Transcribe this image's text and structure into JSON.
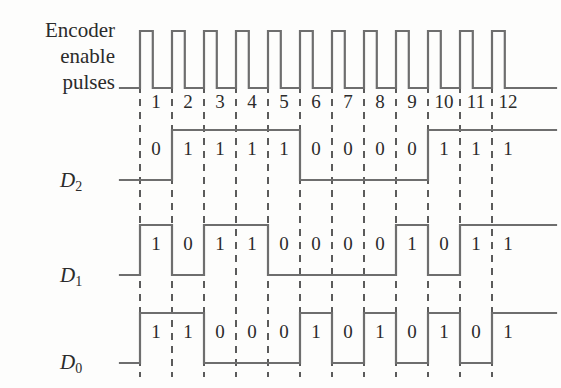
{
  "figure": {
    "title_lines": [
      "Encoder",
      "enable",
      "pulses"
    ],
    "background_color": "#fdfdfc",
    "line_color": "#6e6e6e",
    "text_color": "#2b2b2b",
    "dash_color": "#4a4a4a"
  },
  "chart_data": {
    "type": "line",
    "xlabel": "",
    "ylabel": "",
    "categories": [
      "1",
      "2",
      "3",
      "4",
      "5",
      "6",
      "7",
      "8",
      "9",
      "10",
      "11",
      "12"
    ],
    "grid": true,
    "legend_position": "left",
    "series": [
      {
        "name": "Encoder enable pulses",
        "kind": "clock",
        "values": [
          1,
          1,
          1,
          1,
          1,
          1,
          1,
          1,
          1,
          1,
          1,
          1
        ]
      },
      {
        "name": "D2",
        "kind": "digital",
        "values": [
          0,
          1,
          1,
          1,
          1,
          0,
          0,
          0,
          0,
          1,
          1,
          1
        ]
      },
      {
        "name": "D1",
        "kind": "digital",
        "values": [
          1,
          0,
          1,
          1,
          0,
          0,
          0,
          0,
          1,
          0,
          1,
          1
        ]
      },
      {
        "name": "D0",
        "kind": "digital",
        "values": [
          1,
          1,
          0,
          0,
          0,
          1,
          0,
          1,
          0,
          1,
          0,
          1
        ]
      }
    ]
  },
  "labels": {
    "d2": "D",
    "d2_sub": "2",
    "d1": "D",
    "d1_sub": "1",
    "d0": "D",
    "d0_sub": "0"
  }
}
